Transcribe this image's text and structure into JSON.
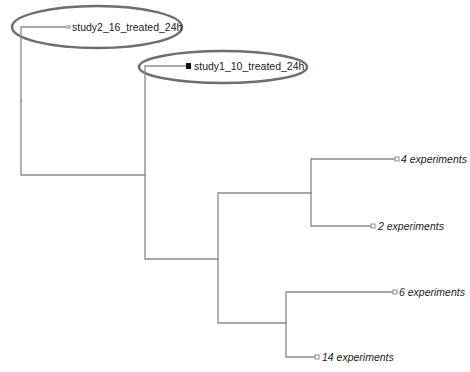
{
  "diagram": {
    "type": "dendrogram",
    "line_color": "#8a8a8a",
    "highlight_color": "#6e6e6e",
    "leaves": [
      {
        "id": "study2",
        "label": "study2_16_treated_24h",
        "italic": false,
        "marker": "grey-square",
        "highlighted": true
      },
      {
        "id": "study1",
        "label": "study1_10_treated_24h",
        "italic": false,
        "marker": "black-square",
        "highlighted": true
      },
      {
        "id": "cluster4",
        "label": "4 experiments",
        "italic": true,
        "marker": "hollow-square",
        "highlighted": false
      },
      {
        "id": "cluster2",
        "label": "2 experiments",
        "italic": true,
        "marker": "hollow-square",
        "highlighted": false
      },
      {
        "id": "cluster6",
        "label": "6 experiments",
        "italic": true,
        "marker": "hollow-square",
        "highlighted": false
      },
      {
        "id": "cluster14",
        "label": "14 experiments",
        "italic": true,
        "marker": "hollow-square",
        "highlighted": false
      }
    ]
  }
}
